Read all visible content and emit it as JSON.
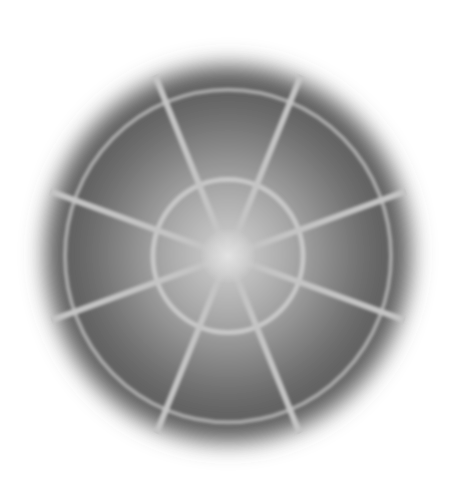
{
  "image": {
    "description": "Blurred grayscale disk with radial spokes and concentric rings (web/radar-like pattern)",
    "width": 452,
    "height": 498,
    "background": "#ffffff"
  },
  "disk": {
    "cx": 228,
    "cy": 254,
    "rx": 194,
    "ry": 200,
    "center_color": "#cfcfcf",
    "mid_color": "#8a8a8a",
    "edge_color": "#555555",
    "blur": 9
  },
  "rings": [
    {
      "name": "inner-ring",
      "r": 75,
      "color": "#c8c8c8",
      "width": 5
    },
    {
      "name": "outer-ring",
      "r": 163,
      "color": "#a8a8a8",
      "width": 4
    }
  ],
  "spokes": {
    "color": "#c4c4c4",
    "width": 6,
    "length": 205,
    "angles_deg": [
      -160,
      -112,
      -68,
      -20,
      20,
      68,
      112,
      160
    ]
  }
}
